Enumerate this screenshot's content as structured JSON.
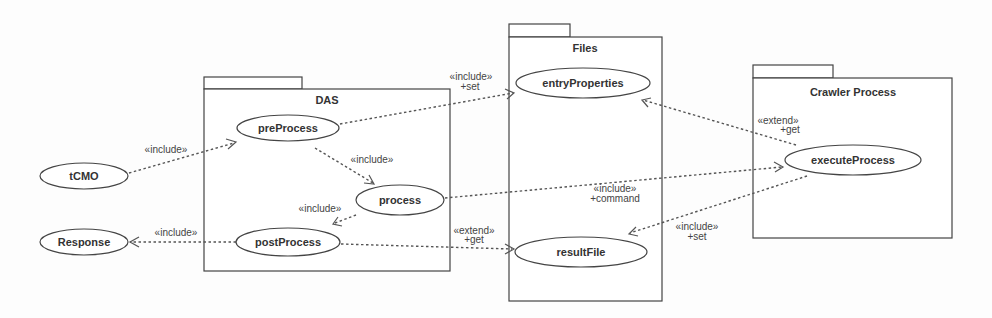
{
  "diagram": {
    "type": "UML use case diagram",
    "packages": [
      {
        "id": "das",
        "title": "DAS"
      },
      {
        "id": "files",
        "title": "Files"
      },
      {
        "id": "crawler",
        "title": "Crawler Process"
      }
    ],
    "use_cases": {
      "tcmo": "tCMO",
      "response": "Response",
      "preprocess": "preProcess",
      "process": "process",
      "postprocess": "postProcess",
      "entryproperties": "entryProperties",
      "resultfile": "resultFile",
      "executeprocess": "executeProcess"
    },
    "relations": [
      {
        "from": "tCMO",
        "to": "preProcess",
        "stereotype": "«include»",
        "role": ""
      },
      {
        "from": "preProcess",
        "to": "process",
        "stereotype": "«include»",
        "role": ""
      },
      {
        "from": "process",
        "to": "postProcess",
        "stereotype": "«include»",
        "role": ""
      },
      {
        "from": "postProcess",
        "to": "Response",
        "stereotype": "«include»",
        "role": ""
      },
      {
        "from": "preProcess",
        "to": "entryProperties",
        "stereotype": "«include»",
        "role": "+set"
      },
      {
        "from": "postProcess",
        "to": "resultFile",
        "stereotype": "«extend»",
        "role": "+get"
      },
      {
        "from": "process",
        "to": "executeProcess",
        "stereotype": "«include»",
        "role": "+command"
      },
      {
        "from": "executeProcess",
        "to": "entryProperties",
        "stereotype": "«extend»",
        "role": "+get"
      },
      {
        "from": "executeProcess",
        "to": "resultFile",
        "stereotype": "«include»",
        "role": "+set"
      }
    ]
  }
}
